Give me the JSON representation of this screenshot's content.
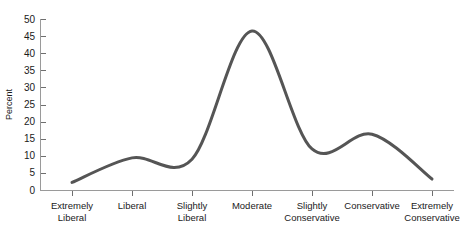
{
  "chart_data": {
    "type": "line",
    "title": "",
    "subtitle": "",
    "xlabel": "",
    "ylabel": "Percent",
    "categories": [
      "Extremely Liberal",
      "Liberal",
      "Slightly Liberal",
      "Moderate",
      "Slightly Conservative",
      "Conservative",
      "Extremely Conservative"
    ],
    "category_lines": [
      [
        "Extremely",
        "Liberal"
      ],
      [
        "Liberal",
        ""
      ],
      [
        "Slightly",
        "Liberal"
      ],
      [
        "Moderate",
        ""
      ],
      [
        "Slightly",
        "Conservative"
      ],
      [
        "Conservative",
        ""
      ],
      [
        "Extremely",
        "Conservative"
      ]
    ],
    "values": [
      2.2,
      9.4,
      9.0,
      46.5,
      12.0,
      16.3,
      3.2
    ],
    "ylim": [
      0,
      50
    ],
    "ytick_values": [
      0,
      5,
      10,
      15,
      20,
      25,
      30,
      35,
      40,
      45,
      50
    ],
    "ytick_labels": [
      "0",
      "5",
      "10",
      "15",
      "20",
      "25",
      "30",
      "35",
      "40",
      "45",
      "50"
    ],
    "grid": false,
    "legend": false,
    "legend_position": "none",
    "smoothing": "spline",
    "series": [
      {
        "name": "Percent",
        "values": [
          2.2,
          9.4,
          9.0,
          46.5,
          12.0,
          16.3,
          3.2
        ],
        "color": "#555555",
        "line_width": 3
      }
    ]
  },
  "colors": {
    "background": "#ffffff",
    "curve": "#555555",
    "axis": "#9a9a9a",
    "tick": "#6f6f6f",
    "text": "#1a1a1a"
  }
}
